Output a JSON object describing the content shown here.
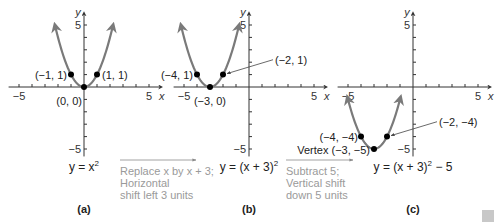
{
  "figure": {
    "style": {
      "curve_color": "#7a7a7a",
      "axis_color": "#333333",
      "point_color": "#000000",
      "note_color": "#9a9a9a",
      "arrow_color": "#8a8a8a"
    },
    "panels": [
      {
        "id": "a",
        "label": "(a)",
        "origin": [
          84,
          87
        ],
        "unit_x": 13,
        "unit_y": 12.4,
        "x_axis_label": "x",
        "y_axis_label": "y",
        "tick_labels": {
          "x_neg": "−5",
          "x_pos": "5",
          "y_pos": "5",
          "y_neg": "−5"
        },
        "equation": {
          "text": "y = x",
          "sup": "2",
          "suffix": ""
        },
        "curve": {
          "h": 0,
          "k": 0,
          "x_from": -2.2,
          "x_to": 2.2
        },
        "points": [
          {
            "x": -1,
            "y": 1,
            "label": "(−1, 1)",
            "anchor": "end",
            "dx": -4,
            "dy": 0
          },
          {
            "x": 1,
            "y": 1,
            "label": "(1, 1)",
            "anchor": "start",
            "dx": 5,
            "dy": 0
          },
          {
            "x": 0,
            "y": 0,
            "label": "(0, 0)",
            "anchor": "end",
            "dx": -2,
            "dy": 14
          }
        ]
      },
      {
        "id": "b",
        "label": "(b)",
        "origin": [
          249,
          87
        ],
        "unit_x": 13,
        "unit_y": 12.4,
        "x_axis_label": "x",
        "y_axis_label": "y",
        "tick_labels": {
          "x_neg": "−5",
          "x_pos": "5",
          "y_pos": "5",
          "y_neg": "−5"
        },
        "equation": {
          "text": "y = (x + 3)",
          "sup": "2",
          "suffix": ""
        },
        "curve": {
          "h": -3,
          "k": 0,
          "x_from": -5.2,
          "x_to": -0.8
        },
        "points": [
          {
            "x": -4,
            "y": 1,
            "label": "(−4, 1)",
            "anchor": "end",
            "dx": -4,
            "dy": 0
          },
          {
            "x": -2,
            "y": 1,
            "label": "(−2, 1)",
            "anchor": "start",
            "leader_to": [
              2,
              2.2
            ],
            "dx": 0,
            "dy": 0
          },
          {
            "x": -3,
            "y": 0,
            "label": "(−3, 0)",
            "anchor": "middle",
            "dx": 0,
            "dy": 14
          }
        ]
      },
      {
        "id": "c",
        "label": "(c)",
        "origin": [
          413,
          87
        ],
        "unit_x": 13,
        "unit_y": 12.4,
        "x_axis_label": "x",
        "y_axis_label": "y",
        "tick_labels": {
          "x_neg": "−5",
          "x_pos": "5",
          "y_pos": "5",
          "y_neg": "−5"
        },
        "equation": {
          "text": "y = (x + 3)",
          "sup": "2",
          "suffix": " − 5"
        },
        "curve": {
          "h": -3,
          "k": -5,
          "x_from": -5.0,
          "x_to": -1.0
        },
        "points": [
          {
            "x": -4,
            "y": -4,
            "label": "(−4, −4)",
            "anchor": "end",
            "dx": -3,
            "dy": 0
          },
          {
            "x": -2,
            "y": -4,
            "label": "(−2, −4)",
            "anchor": "start",
            "leader_to": [
              2,
              -2.8
            ],
            "dx": 0,
            "dy": 0
          },
          {
            "x": -3,
            "y": -5,
            "label": "Vertex (−3, −5)",
            "anchor": "end",
            "dx": -4,
            "dy": 1
          }
        ]
      }
    ],
    "transformations": [
      {
        "arrow": {
          "x1": 120,
          "x2": 196,
          "y": 160
        },
        "lines": [
          "Replace x by x + 3;",
          "Horizontal",
          "shift left 3 units"
        ],
        "x": 120,
        "y": 175
      },
      {
        "arrow": {
          "x1": 286,
          "x2": 353,
          "y": 160
        },
        "lines": [
          "Subtract 5;",
          "Vertical shift",
          "down 5 units"
        ],
        "x": 286,
        "y": 175
      }
    ]
  }
}
